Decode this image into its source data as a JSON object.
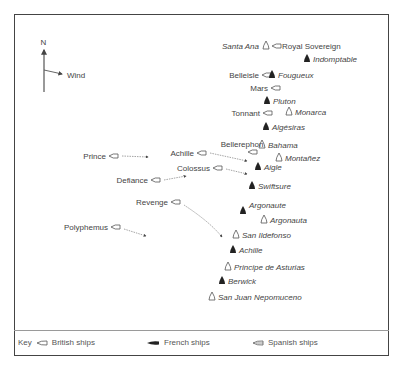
{
  "compass": {
    "north_label": "N",
    "wind_label": "Wind"
  },
  "ships": [
    {
      "name": "Santa Ana",
      "nation": "spanish",
      "x": 266,
      "y": 46,
      "label_side": "left"
    },
    {
      "name": "Royal Sovereign",
      "nation": "british",
      "x": 276,
      "y": 46,
      "label_side": "right"
    },
    {
      "name": "Indomptable",
      "nation": "french",
      "x": 307,
      "y": 59,
      "label_side": "right"
    },
    {
      "name": "Belleisle",
      "nation": "british",
      "x": 266,
      "y": 75,
      "label_side": "left"
    },
    {
      "name": "Fougueux",
      "nation": "french",
      "x": 272,
      "y": 75,
      "label_side": "right"
    },
    {
      "name": "Mars",
      "nation": "british",
      "x": 275,
      "y": 88,
      "label_side": "left"
    },
    {
      "name": "Pluton",
      "nation": "french",
      "x": 267,
      "y": 101,
      "label_side": "right"
    },
    {
      "name": "Tonnant",
      "nation": "british",
      "x": 267,
      "y": 113,
      "label_side": "left"
    },
    {
      "name": "Monarca",
      "nation": "spanish",
      "x": 289,
      "y": 112,
      "label_side": "right"
    },
    {
      "name": "Algésiras",
      "nation": "french",
      "x": 266,
      "y": 127,
      "label_side": "right"
    },
    {
      "name": "Bellerephon",
      "nation": "british",
      "x": 252,
      "y": 152,
      "label_side": "top"
    },
    {
      "name": "Bahama",
      "nation": "spanish",
      "x": 262,
      "y": 145,
      "label_side": "right"
    },
    {
      "name": "Montañez",
      "nation": "spanish",
      "x": 279,
      "y": 158,
      "label_side": "right"
    },
    {
      "name": "Aigle",
      "nation": "french",
      "x": 258,
      "y": 167,
      "label_side": "right"
    },
    {
      "name": "Achille",
      "nation": "british",
      "x": 201,
      "y": 153,
      "label_side": "left"
    },
    {
      "name": "Colossus",
      "nation": "british",
      "x": 217,
      "y": 168,
      "label_side": "left"
    },
    {
      "name": "Prince",
      "nation": "british",
      "x": 113,
      "y": 156,
      "label_side": "left"
    },
    {
      "name": "Defiance",
      "nation": "british",
      "x": 155,
      "y": 180,
      "label_side": "left"
    },
    {
      "name": "Swiftsure",
      "nation": "french",
      "x": 252,
      "y": 186,
      "label_side": "right"
    },
    {
      "name": "Revenge",
      "nation": "british",
      "x": 175,
      "y": 202,
      "label_side": "left"
    },
    {
      "name": "Argonaute",
      "nation": "french",
      "x": 243,
      "y": 211,
      "label_side": "right-top"
    },
    {
      "name": "Argonauta",
      "nation": "spanish",
      "x": 264,
      "y": 220,
      "label_side": "right"
    },
    {
      "name": "Polyphemus",
      "nation": "british",
      "x": 115,
      "y": 227,
      "label_side": "left"
    },
    {
      "name": "San Ildefonso",
      "nation": "spanish",
      "x": 236,
      "y": 235,
      "label_side": "right"
    },
    {
      "name": "Achille",
      "nation": "french",
      "x": 233,
      "y": 250,
      "label_side": "right"
    },
    {
      "name": "Principe de Asturias",
      "nation": "spanish",
      "x": 228,
      "y": 267,
      "label_side": "right"
    },
    {
      "name": "Berwick",
      "nation": "french",
      "x": 222,
      "y": 281,
      "label_side": "right"
    },
    {
      "name": "San Juan Nepomuceno",
      "nation": "spanish",
      "x": 212,
      "y": 297,
      "label_side": "right"
    }
  ],
  "movement_arrows": [
    {
      "from": "Prince",
      "path": "M122,156 L148,157"
    },
    {
      "from": "Achille",
      "path": "M210,153 L247,161"
    },
    {
      "from": "Colossus",
      "path": "M226,169 L247,174"
    },
    {
      "from": "Defiance",
      "path": "M164,180 L186,176"
    },
    {
      "from": "Revenge",
      "path": "M184,205 Q210,222 222,237"
    },
    {
      "from": "Polyphemus",
      "path": "M124,229 L146,236"
    }
  ],
  "key": {
    "title": "Key",
    "items": [
      {
        "label": "British ships",
        "nation": "british"
      },
      {
        "label": "French ships",
        "nation": "french"
      },
      {
        "label": "Spanish ships",
        "nation": "spanish"
      }
    ]
  },
  "colors": {
    "frame": "#444444",
    "text": "#444444",
    "french_fill": "#222222",
    "outline": "#555555"
  }
}
